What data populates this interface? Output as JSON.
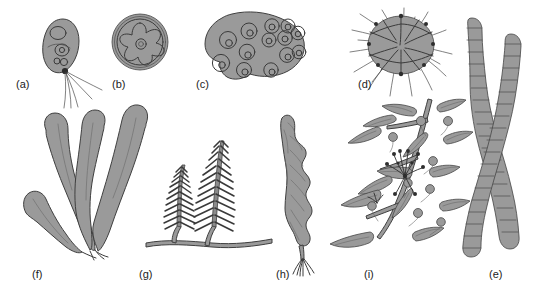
{
  "figure": {
    "background_color": "#ffffff",
    "fill_color": "#9a9a9a",
    "stroke_color": "#3a3a3a",
    "label_color": "#1c1c1c",
    "width": 539,
    "height": 289
  },
  "panels": [
    {
      "id": "a",
      "label": "(a)",
      "subject": "flagellate-cell",
      "description": "Ovoid unicellular flagellate with nucleus, chloroplast and four trailing flagella",
      "label_x": 16,
      "label_y": 78
    },
    {
      "id": "b",
      "label": "(b)",
      "subject": "coccoid-cell-star-chloroplast",
      "description": "Spherical cell in a double-walled envelope enclosing a star-shaped chloroplast with central pyrenoid",
      "label_x": 112,
      "label_y": 78
    },
    {
      "id": "c",
      "label": "(c)",
      "subject": "colonial-cell-aggregate",
      "description": "Lobed gelatinous colony containing twelve rounded cells each with a nucleus",
      "label_x": 196,
      "label_y": 78
    },
    {
      "id": "d",
      "label": "(d)",
      "subject": "foraminiferan-with-spines",
      "description": "Multi-chambered spherical test surrounded by long radiating spines",
      "label_x": 358,
      "label_y": 78
    },
    {
      "id": "e",
      "label": "(e)",
      "subject": "filamentous-alga",
      "description": "Two elongate unbranched filaments divided into stacked cells with rounded apices",
      "label_x": 489,
      "label_y": 268
    },
    {
      "id": "f",
      "label": "(f)",
      "subject": "blade-kelp-thallus",
      "description": "Kelp-like thallus with four broad undulating blades arising from a single basal holdfast",
      "label_x": 32,
      "label_y": 268
    },
    {
      "id": "g",
      "label": "(g)",
      "subject": "feather-alga-caulerpa",
      "description": "Two feather-shaped erect fronds with pinnate branchlets rising from a creeping stolon",
      "label_x": 139,
      "label_y": 268
    },
    {
      "id": "h",
      "label": "(h)",
      "subject": "ruffled-blade-alga",
      "description": "Narrow ruffled-margined blade tapering to a small fibrous holdfast",
      "label_x": 276,
      "label_y": 268
    },
    {
      "id": "i",
      "label": "(i)",
      "subject": "sargassum-branch",
      "description": "Branched axis bearing lanceolate serrated leaves, spherical air bladders and a flowering cluster",
      "label_x": 364,
      "label_y": 268
    }
  ]
}
